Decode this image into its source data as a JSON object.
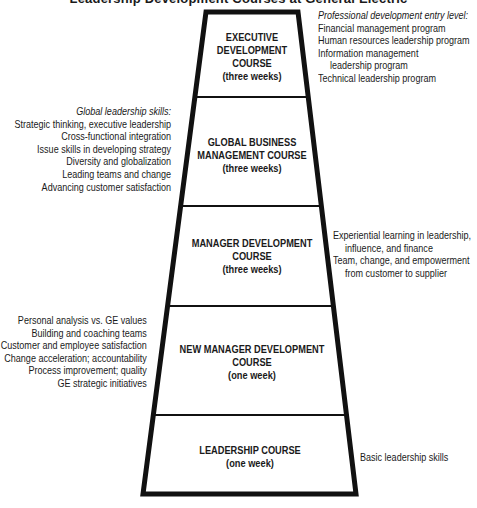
{
  "title": "Leadership Development Courses at General Electric",
  "pyramid": {
    "stroke_color": "#111111",
    "levels": [
      {
        "name": "EXECUTIVE DEVELOPMENT COURSE",
        "lines": [
          "EXECUTIVE",
          "DEVELOPMENT",
          "COURSE"
        ],
        "duration": "(three weeks)"
      },
      {
        "name": "GLOBAL BUSINESS MANAGEMENT COURSE",
        "lines": [
          "GLOBAL BUSINESS",
          "MANAGEMENT COURSE"
        ],
        "duration": "(three weeks)"
      },
      {
        "name": "MANAGER DEVELOPMENT COURSE",
        "lines": [
          "MANAGER DEVELOPMENT",
          "COURSE"
        ],
        "duration": "(three weeks)"
      },
      {
        "name": "NEW MANAGER DEVELOPMENT COURSE",
        "lines": [
          "NEW MANAGER DEVELOPMENT",
          "COURSE"
        ],
        "duration": "(one week)"
      },
      {
        "name": "LEADERSHIP COURSE",
        "lines": [
          "LEADERSHIP COURSE"
        ],
        "duration": "(one week)"
      }
    ]
  },
  "annotations": {
    "executive": {
      "header": "Professional development entry level:",
      "items": [
        "Financial management program",
        "Human resources leadership program",
        "Information management",
        "leadership program",
        "Technical leadership program"
      ]
    },
    "global": {
      "header": "Global leadership skills:",
      "items": [
        "Strategic thinking, executive leadership",
        "Cross-functional integration",
        "Issue skills in developing strategy",
        "Diversity and globalization",
        "Leading teams and change",
        "Advancing customer satisfaction"
      ]
    },
    "manager": {
      "items": [
        "Experiential learning in leadership,",
        "influence, and finance",
        "Team, change, and empowerment",
        "from customer to supplier"
      ]
    },
    "new_manager": {
      "items": [
        "Personal analysis vs. GE values",
        "Building and coaching teams",
        "Customer and employee satisfaction",
        "Change acceleration; accountability",
        "Process improvement; quality",
        "GE strategic initiatives"
      ]
    },
    "leadership": {
      "items": [
        "Basic leadership skills"
      ]
    }
  }
}
